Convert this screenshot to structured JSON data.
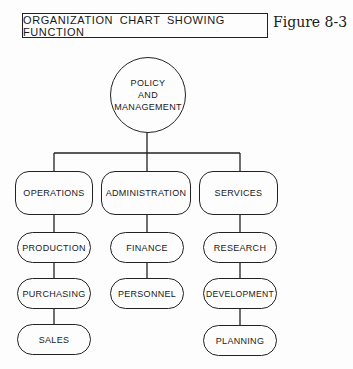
{
  "header": {
    "title": "ORGANIZATION CHART SHOWING FUNCTION",
    "figure_label": "Figure 8-3"
  },
  "root": {
    "lines": [
      "POLICY",
      "AND",
      "MANAGEMENT"
    ]
  },
  "departments": [
    {
      "label": "OPERATIONS",
      "children": [
        "PRODUCTION",
        "PURCHASING",
        "SALES"
      ]
    },
    {
      "label": "ADMINISTRATION",
      "children": [
        "FINANCE",
        "PERSONNEL"
      ]
    },
    {
      "label": "SERVICES",
      "children": [
        "RESEARCH",
        "DEVELOPMENT",
        "PLANNING"
      ]
    }
  ],
  "colors": {
    "line": "#222222",
    "background": "#fdfdfd"
  }
}
